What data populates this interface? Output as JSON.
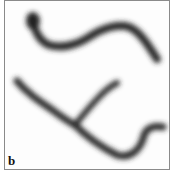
{
  "figure": {
    "panel_label": "b",
    "colors": {
      "background": "#fdfdfd",
      "filament": "#2a2a2a",
      "border": "#8a8a8a"
    }
  }
}
